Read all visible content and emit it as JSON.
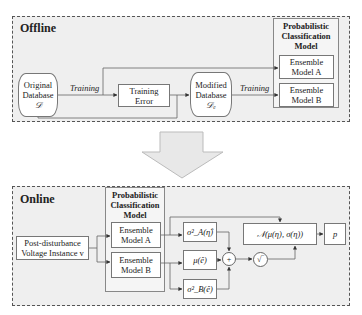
{
  "offline": {
    "title": "Offline",
    "original_db": {
      "line1": "Original",
      "line2": "Database",
      "symbol": "𝒟"
    },
    "training_label_1": "Training",
    "training_error": {
      "line1": "Training",
      "line2": "Error"
    },
    "modified_db": {
      "line1": "Modified",
      "line2": "Database",
      "symbol": "𝒟ₑ"
    },
    "training_label_2": "Training",
    "model_group": {
      "title_line1": "Probabilistic",
      "title_line2": "Classification",
      "title_line3": "Model",
      "model_a": {
        "line1": "Ensemble",
        "line2": "Model A"
      },
      "model_b": {
        "line1": "Ensemble",
        "line2": "Model B"
      }
    }
  },
  "transition_arrow": "down-arrow",
  "online": {
    "title": "Online",
    "input": {
      "line1": "Post-disturbance",
      "line2": "Voltage Instance v"
    },
    "model_group": {
      "title_line1": "Probabilistic",
      "title_line2": "Classification",
      "title_line3": "Model",
      "model_a": {
        "line1": "Ensemble",
        "line2": "Model A"
      },
      "model_b": {
        "line1": "Ensemble",
        "line2": "Model B"
      }
    },
    "sigma_a": "σ²_A(η̂)",
    "mu_e": "μ(ê)",
    "sigma_b": "σ²_B(ê)",
    "sum_symbol": "+",
    "sqrt_symbol": "√‾",
    "normal": "𝒩(μ(η), σ(η))",
    "output": "p"
  }
}
